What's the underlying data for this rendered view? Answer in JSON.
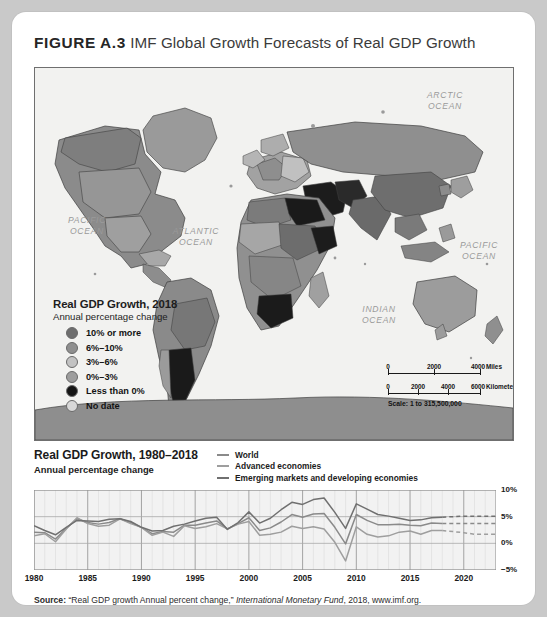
{
  "figure": {
    "label": "FIGURE A.3",
    "title": " IMF Global Growth Forecasts of Real GDP Growth"
  },
  "map": {
    "ocean_labels": [
      {
        "text": "PACIFIC\nOCEAN",
        "x": 38,
        "y": 152
      },
      {
        "text": "ATLANTIC\nOCEAN",
        "x": 140,
        "y": 163
      },
      {
        "text": "ARCTIC\nOCEAN",
        "x": 396,
        "y": 25
      },
      {
        "text": "INDIAN\nOCEAN",
        "x": 330,
        "y": 240
      },
      {
        "text": "PACIFIC\nOCEAN",
        "x": 424,
        "y": 176
      }
    ],
    "legend": {
      "title": "Real GDP Growth, 2018",
      "subtitle": "Annual percentage change",
      "items": [
        {
          "label": "10% or more",
          "color": "#6e6e6e"
        },
        {
          "label": "6%–10%",
          "color": "#8f8f8f"
        },
        {
          "label": "3%–6%",
          "color": "#c2c2c2"
        },
        {
          "label": "0%–3%",
          "color": "#9d9d9d"
        },
        {
          "label": "Less than 0%",
          "color": "#151515"
        },
        {
          "label": "No date",
          "color": "#d8d8d8"
        }
      ]
    },
    "scale": {
      "miles": {
        "ticks": [
          "0",
          "2000",
          "4000"
        ],
        "unit": "Miles"
      },
      "kilometers": {
        "ticks": [
          "0",
          "2000",
          "4000",
          "6000"
        ],
        "unit": "Kilometers"
      },
      "ratio": "Scale: 1 to 315,500,000"
    }
  },
  "chart_head": {
    "title": "Real GDP Growth, 1980–2018",
    "subtitle": "Annual percentage change"
  },
  "source": {
    "label": "Source:",
    "quote": " “Real GDP growth Annual percent change,” ",
    "publisher": "International Monetary Fund",
    "tail": ", 2018, www.imf.org."
  },
  "chart_data": {
    "type": "line",
    "title": "Real GDP Growth, 1980–2018",
    "subtitle": "Annual percentage change",
    "xlabel": "",
    "ylabel": "Annual percentage change",
    "xlim": [
      1980,
      2023
    ],
    "ylim": [
      -5,
      10
    ],
    "yticks": [
      10,
      5,
      0,
      -5
    ],
    "ytick_labels": [
      "10%",
      "5%",
      "0%",
      "−5%"
    ],
    "xticks": [
      1980,
      1985,
      1990,
      1995,
      2000,
      2005,
      2010,
      2015,
      2020
    ],
    "xtick_labels": [
      "1980",
      "1985",
      "1990",
      "1995",
      "2000",
      "2005",
      "2010",
      "2015",
      "2020"
    ],
    "grid": true,
    "legend_position": "top-right",
    "forecast_starts": 2018,
    "forecast_style": "dashed",
    "x": [
      1980,
      1981,
      1982,
      1983,
      1984,
      1985,
      1986,
      1987,
      1988,
      1989,
      1990,
      1991,
      1992,
      1993,
      1994,
      1995,
      1996,
      1997,
      1998,
      1999,
      2000,
      2001,
      2002,
      2003,
      2004,
      2005,
      2006,
      2007,
      2008,
      2009,
      2010,
      2011,
      2012,
      2013,
      2014,
      2015,
      2016,
      2017,
      2018,
      2019,
      2020,
      2021,
      2022,
      2023
    ],
    "series": [
      {
        "name": "World",
        "color": "#8a8a8a",
        "values": [
          2.1,
          2.0,
          0.8,
          2.8,
          4.6,
          3.9,
          3.6,
          3.9,
          4.6,
          3.9,
          3.0,
          1.8,
          2.2,
          2.1,
          3.4,
          3.4,
          3.8,
          4.2,
          2.7,
          3.7,
          4.8,
          2.4,
          2.9,
          4.0,
          5.4,
          4.9,
          5.5,
          5.6,
          3.0,
          -0.1,
          5.4,
          4.3,
          3.5,
          3.5,
          3.6,
          3.4,
          3.3,
          3.8,
          3.7,
          3.7,
          3.7,
          3.7,
          3.7,
          3.7
        ]
      },
      {
        "name": "Advanced economies",
        "color": "#9e9e9e",
        "values": [
          1.4,
          1.8,
          0.3,
          2.7,
          4.8,
          3.7,
          3.2,
          3.4,
          4.6,
          3.7,
          3.0,
          1.5,
          2.1,
          1.3,
          3.3,
          2.8,
          3.1,
          3.7,
          2.7,
          3.6,
          4.1,
          1.5,
          1.7,
          2.1,
          3.2,
          2.8,
          3.1,
          2.7,
          0.2,
          -3.3,
          3.1,
          1.7,
          1.2,
          1.4,
          2.1,
          2.3,
          1.7,
          2.4,
          2.4,
          2.2,
          2.0,
          1.7,
          1.7,
          1.7
        ]
      },
      {
        "name": "Emerging markets and developing economies",
        "color": "#707070",
        "values": [
          3.3,
          2.4,
          1.6,
          3.0,
          4.3,
          4.2,
          4.1,
          4.5,
          4.6,
          4.1,
          3.0,
          2.3,
          2.4,
          3.2,
          3.6,
          4.2,
          4.7,
          4.9,
          2.6,
          3.9,
          5.9,
          3.8,
          4.7,
          6.3,
          7.7,
          7.3,
          8.2,
          8.5,
          5.8,
          2.8,
          7.4,
          6.4,
          5.4,
          5.1,
          4.7,
          4.3,
          4.4,
          4.8,
          4.9,
          5.0,
          5.1,
          5.1,
          5.1,
          5.1
        ]
      }
    ]
  }
}
